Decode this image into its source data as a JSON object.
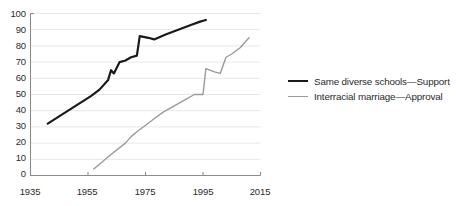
{
  "chart_data": {
    "type": "line",
    "title": "",
    "xlabel": "",
    "ylabel": "",
    "xlim": [
      1935,
      2015
    ],
    "ylim": [
      0,
      100
    ],
    "xticks": [
      1935,
      1955,
      1975,
      1995,
      2015
    ],
    "yticks": [
      0,
      10,
      20,
      30,
      40,
      50,
      60,
      70,
      80,
      90,
      100
    ],
    "grid": true,
    "legend_position": "right",
    "series": [
      {
        "name": "Same diverse schools—Support",
        "color": "#1a1a1a",
        "points": [
          [
            1941,
            32
          ],
          [
            1956,
            49
          ],
          [
            1959,
            53
          ],
          [
            1962,
            59
          ],
          [
            1963,
            65
          ],
          [
            1964,
            63
          ],
          [
            1966,
            70
          ],
          [
            1968,
            71
          ],
          [
            1970,
            73
          ],
          [
            1972,
            74
          ],
          [
            1973,
            86
          ],
          [
            1976,
            85
          ],
          [
            1978,
            84
          ],
          [
            1982,
            87
          ],
          [
            1985,
            89
          ],
          [
            1988,
            91
          ],
          [
            1991,
            93
          ],
          [
            1994,
            95
          ],
          [
            1996,
            96
          ]
        ]
      },
      {
        "name": "Interracial marriage—Approval",
        "color": "#9a9a9a",
        "points": [
          [
            1957,
            4
          ],
          [
            1963,
            13
          ],
          [
            1968,
            20
          ],
          [
            1970,
            24
          ],
          [
            1972,
            27
          ],
          [
            1975,
            31
          ],
          [
            1978,
            35
          ],
          [
            1981,
            39
          ],
          [
            1985,
            43
          ],
          [
            1989,
            47
          ],
          [
            1992,
            50
          ],
          [
            1995,
            50
          ],
          [
            1996,
            66
          ],
          [
            1999,
            64
          ],
          [
            2001,
            63
          ],
          [
            2003,
            73
          ],
          [
            2005,
            75
          ],
          [
            2008,
            79
          ],
          [
            2011,
            85
          ]
        ]
      }
    ]
  },
  "axis": {
    "y_tick_labels": [
      "100",
      "90",
      "80",
      "70",
      "60",
      "50",
      "40",
      "30",
      "20",
      "10",
      "0"
    ],
    "x_tick_labels": [
      "1935",
      "1955",
      "1975",
      "1995",
      "2015"
    ]
  },
  "legend": {
    "entries": [
      {
        "label": "Same diverse schools—Support"
      },
      {
        "label": "Interracial marriage—Approval"
      }
    ]
  }
}
